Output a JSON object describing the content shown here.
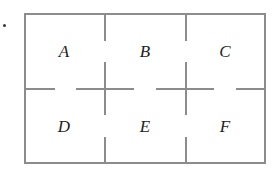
{
  "diagram": {
    "bullet": "•",
    "rooms": [
      {
        "label": "A",
        "x": 64,
        "y": 52
      },
      {
        "label": "B",
        "x": 145,
        "y": 52
      },
      {
        "label": "C",
        "x": 225,
        "y": 52
      },
      {
        "label": "D",
        "x": 64,
        "y": 127
      },
      {
        "label": "E",
        "x": 145,
        "y": 127
      },
      {
        "label": "F",
        "x": 225,
        "y": 127
      }
    ],
    "line_color": "#8c8c8c"
  }
}
